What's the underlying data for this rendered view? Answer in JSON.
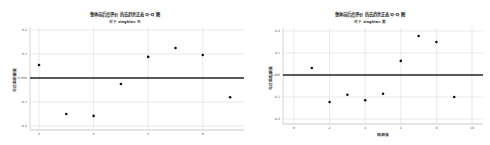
{
  "charts": [
    {
      "title": "整体前后度评价 的去趋势正态 Q-Q 图",
      "subtitle": "对于 singhle= 否",
      "xlabel": "",
      "ylabel": "与正态的偏差",
      "y_ticks": [
        "0.2",
        "0.1",
        "0.000",
        "-0.1",
        "-0.2"
      ],
      "x_ticks": [
        "2",
        "4",
        "6",
        "8"
      ]
    },
    {
      "title": "整体前后度评价 的去趋势正态 Q-Q 图",
      "subtitle": "对于 singhle= 是",
      "xlabel": "观测值",
      "ylabel": "与正态的偏差",
      "y_ticks": [
        "0.2",
        "0.1",
        "0.000",
        "-0.1",
        "-0.2"
      ],
      "x_ticks": [
        "0",
        "2",
        "4",
        "6",
        "8",
        "10"
      ]
    }
  ],
  "chart_data": [
    {
      "type": "scatter",
      "title": "整体前后度评价 的去趋势正态 Q-Q 图",
      "subtitle": "对于 singhle= 否",
      "xlabel": "",
      "ylabel": "与正态的偏差",
      "x": [
        2,
        3,
        4,
        5,
        6,
        7,
        8,
        9
      ],
      "y": [
        0.054,
        -0.15,
        -0.158,
        -0.025,
        0.088,
        0.125,
        0.096,
        -0.08
      ],
      "xlim": [
        1.7,
        9.5
      ],
      "ylim": [
        -0.21,
        0.21
      ],
      "reference_line": 0,
      "grid": true
    },
    {
      "type": "scatter",
      "title": "整体前后度评价 的去趋势正态 Q-Q 图",
      "subtitle": "对于 singhle= 是",
      "xlabel": "观测值",
      "ylabel": "与正态的偏差",
      "x": [
        1,
        2,
        3,
        4,
        5,
        6,
        7,
        8,
        9
      ],
      "y": [
        0.032,
        -0.123,
        -0.09,
        -0.115,
        -0.085,
        0.064,
        0.177,
        0.15,
        -0.1
      ],
      "xlim": [
        -0.5,
        10.5
      ],
      "ylim": [
        -0.21,
        0.21
      ],
      "reference_line": 0,
      "grid": true
    }
  ]
}
